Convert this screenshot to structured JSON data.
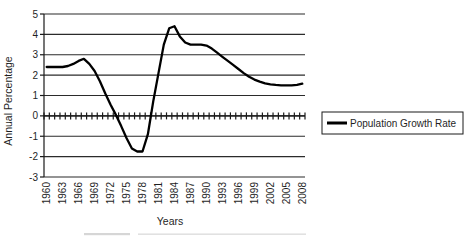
{
  "chart_data": {
    "type": "line",
    "title": "",
    "xlabel": "Years",
    "ylabel": "Annual Percentage",
    "categories": [
      "1960",
      "1961",
      "1962",
      "1963",
      "1964",
      "1965",
      "1966",
      "1967",
      "1968",
      "1969",
      "1970",
      "1971",
      "1972",
      "1973",
      "1974",
      "1975",
      "1976",
      "1977",
      "1978",
      "1979",
      "1980",
      "1981",
      "1982",
      "1983",
      "1984",
      "1985",
      "1986",
      "1987",
      "1988",
      "1989",
      "1990",
      "1991",
      "1992",
      "1993",
      "1994",
      "1995",
      "1996",
      "1997",
      "1998",
      "1999",
      "2000",
      "2001",
      "2002",
      "2003",
      "2004",
      "2005",
      "2006",
      "2007",
      "2008"
    ],
    "series": [
      {
        "name": "Population Growth Rate",
        "values": [
          2.4,
          2.4,
          2.4,
          2.4,
          2.45,
          2.55,
          2.7,
          2.8,
          2.55,
          2.2,
          1.7,
          1.1,
          0.55,
          0.05,
          -0.5,
          -1.1,
          -1.6,
          -1.75,
          -1.75,
          -0.9,
          0.7,
          2.1,
          3.5,
          4.3,
          4.4,
          3.9,
          3.6,
          3.5,
          3.5,
          3.5,
          3.45,
          3.3,
          3.1,
          2.9,
          2.7,
          2.5,
          2.3,
          2.1,
          1.92,
          1.78,
          1.68,
          1.6,
          1.55,
          1.52,
          1.5,
          1.5,
          1.5,
          1.52,
          1.58
        ]
      }
    ],
    "ylim": [
      -3,
      5
    ],
    "yticks": [
      5,
      4,
      3,
      2,
      1,
      0,
      -1,
      -2,
      -3
    ],
    "x_tick_label_step": 3,
    "x_axis_crosses_at": 0,
    "grid": "horizontal",
    "legend_position": "right-middle",
    "line_color": "#000000",
    "background": "#ffffff"
  }
}
